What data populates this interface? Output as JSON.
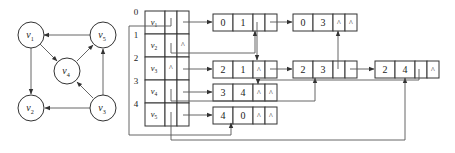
{
  "graph": {
    "vertices": [
      {
        "id": "v1",
        "label": "v",
        "sub": "1",
        "cx": 31,
        "cy": 35
      },
      {
        "id": "v5",
        "label": "v",
        "sub": "5",
        "cx": 103,
        "cy": 35
      },
      {
        "id": "v4",
        "label": "v",
        "sub": "4",
        "cx": 67,
        "cy": 71
      },
      {
        "id": "v2",
        "label": "v",
        "sub": "2",
        "cx": 31,
        "cy": 108
      },
      {
        "id": "v3",
        "label": "v",
        "sub": "3",
        "cx": 103,
        "cy": 108
      }
    ],
    "arcs": [
      {
        "from": "v1",
        "to": "v2"
      },
      {
        "from": "v1",
        "to": "v4"
      },
      {
        "from": "v3",
        "to": "v2"
      },
      {
        "from": "v3",
        "to": "v4"
      },
      {
        "from": "v3",
        "to": "v5"
      },
      {
        "from": "v4",
        "to": "v5"
      },
      {
        "from": "v5",
        "to": "v1"
      }
    ]
  },
  "vertex_table": {
    "indices": [
      "0",
      "1",
      "2",
      "3",
      "4"
    ],
    "rows": [
      {
        "data": "v",
        "sub": "1",
        "firstin": "",
        "firstout": ""
      },
      {
        "data": "v",
        "sub": "2",
        "firstin": "",
        "firstout": "^"
      },
      {
        "data": "v",
        "sub": "3",
        "firstin": "^",
        "firstout": ""
      },
      {
        "data": "v",
        "sub": "4",
        "firstin": "",
        "firstout": ""
      },
      {
        "data": "v",
        "sub": "5",
        "firstin": "",
        "firstout": ""
      }
    ]
  },
  "arc_nodes": [
    {
      "id": "a01",
      "tail": "0",
      "head": "1",
      "hlink": "",
      "tlink": "",
      "x": 213,
      "y": 14
    },
    {
      "id": "a03",
      "tail": "0",
      "head": "3",
      "hlink": "^",
      "tlink": "^",
      "x": 293,
      "y": 14
    },
    {
      "id": "a21",
      "tail": "2",
      "head": "1",
      "hlink": "^",
      "tlink": "",
      "x": 213,
      "y": 61
    },
    {
      "id": "a23",
      "tail": "2",
      "head": "3",
      "hlink": "",
      "tlink": "",
      "x": 293,
      "y": 61
    },
    {
      "id": "a24",
      "tail": "2",
      "head": "4",
      "hlink": "",
      "tlink": "^",
      "x": 375,
      "y": 61
    },
    {
      "id": "a34",
      "tail": "3",
      "head": "4",
      "hlink": "^",
      "tlink": "^",
      "x": 213,
      "y": 84
    },
    {
      "id": "a40",
      "tail": "4",
      "head": "0",
      "hlink": "^",
      "tlink": "^",
      "x": 213,
      "y": 107
    }
  ],
  "colors": {
    "line": "#555555",
    "box": "#333333",
    "text": "#222222"
  }
}
